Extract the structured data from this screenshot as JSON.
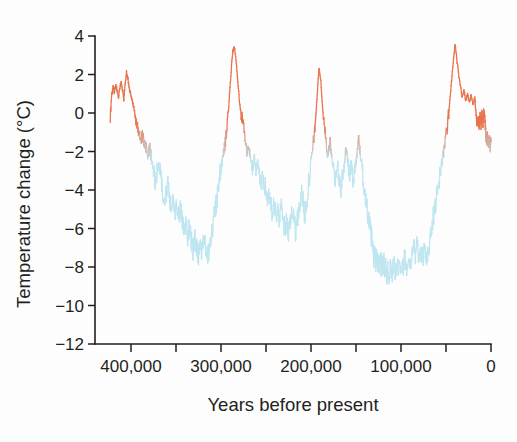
{
  "figure": {
    "background_color": "#fdfdfd",
    "text_color": "#231f20"
  },
  "chart_data": {
    "type": "line",
    "title": "",
    "subtitle": "",
    "xlabel": "Years before present",
    "ylabel": "Temperature change (°C)",
    "xlim": [
      440000,
      0
    ],
    "ylim": [
      -12,
      4
    ],
    "x_inverted": true,
    "grid": false,
    "legend": null,
    "legend_position": "none",
    "x_tick_labels": [
      "400,000",
      "300,000",
      "200,000",
      "100,000",
      "0"
    ],
    "x_tick_values": [
      400000,
      300000,
      200000,
      100000,
      0
    ],
    "x_minor_tick_values": [
      400000,
      350000,
      300000,
      250000,
      200000,
      150000,
      100000,
      50000,
      0
    ],
    "y_tick_labels": [
      "4",
      "2",
      "0",
      "−2",
      "−4",
      "−6",
      "−8",
      "−10",
      "−12"
    ],
    "y_tick_values": [
      4,
      2,
      0,
      -2,
      -4,
      -6,
      -8,
      -10,
      -12
    ],
    "colors": {
      "warm": "#e8734c",
      "cold": "#bfe6f0",
      "axis": "#231f20"
    },
    "color_threshold_c": -1.5,
    "series": [
      {
        "name": "Antarctic ice-core temperature change",
        "units": "°C",
        "x": [
          423000,
          421500,
          420000,
          418500,
          417000,
          415500,
          414000,
          412500,
          411000,
          409500,
          408000,
          406500,
          405000,
          403500,
          402000,
          400500,
          399000,
          397500,
          396000,
          394500,
          393000,
          391000,
          389000,
          387000,
          385000,
          383000,
          381000,
          379000,
          377000,
          375000,
          373000,
          371000,
          369000,
          367000,
          365000,
          363000,
          361000,
          359000,
          357000,
          355000,
          353000,
          351000,
          349000,
          347000,
          345000,
          343000,
          341000,
          339000,
          337000,
          335000,
          333000,
          331000,
          329000,
          327000,
          325000,
          323000,
          321000,
          319000,
          317000,
          315000,
          313000,
          311000,
          309000,
          307000,
          305000,
          303000,
          301000,
          299000,
          297000,
          295000,
          293000,
          291000,
          289000,
          287000,
          285000,
          283000,
          281000,
          279000,
          277000,
          275000,
          273000,
          271000,
          269000,
          267000,
          265000,
          263000,
          261000,
          259000,
          257000,
          255000,
          253000,
          251000,
          249000,
          247000,
          245000,
          243000,
          241000,
          239000,
          237000,
          235000,
          233000,
          231000,
          229000,
          227000,
          225000,
          223000,
          221000,
          219000,
          217000,
          215000,
          213000,
          211000,
          209000,
          207000,
          205000,
          203000,
          201000,
          199000,
          197000,
          195000,
          193000,
          191000,
          189000,
          187000,
          185000,
          183000,
          181000,
          179000,
          177000,
          175000,
          173000,
          171000,
          169000,
          167000,
          165000,
          163000,
          161000,
          159000,
          157000,
          155000,
          153000,
          151000,
          149000,
          147000,
          145000,
          143000,
          141000,
          139000,
          137000,
          135000,
          133000,
          131000,
          130000,
          129000,
          128000,
          127000,
          126000,
          125000,
          124000,
          123000,
          122000,
          121000,
          120000,
          119000,
          118000,
          117000,
          116000,
          115000,
          114000,
          112000,
          110000,
          108000,
          106000,
          104000,
          102000,
          100000,
          98000,
          96000,
          94000,
          92000,
          90000,
          88000,
          86000,
          84000,
          82000,
          80000,
          78000,
          76000,
          74000,
          72000,
          70000,
          68000,
          66000,
          64000,
          62000,
          60000,
          58000,
          56000,
          54000,
          52000,
          50000,
          48000,
          46000,
          44000,
          42000,
          40000,
          38000,
          36000,
          34000,
          32000,
          30000,
          28000,
          26000,
          24000,
          22000,
          20000,
          18000,
          17000,
          16000,
          15000,
          14000,
          13000,
          12000,
          11000,
          10000,
          9000,
          8000,
          7000,
          6000,
          5000,
          4000,
          3000,
          2000,
          1000,
          0
        ],
        "y": [
          -0.2,
          0.9,
          1.4,
          1.1,
          1.5,
          1.2,
          0.8,
          1.3,
          1.6,
          1.2,
          0.7,
          1.5,
          2.1,
          1.8,
          1.3,
          1.0,
          0.7,
          0.4,
          0.1,
          -0.3,
          -0.6,
          -1.0,
          -1.3,
          -1.2,
          -1.5,
          -1.8,
          -2.1,
          -1.9,
          -2.4,
          -3.0,
          -3.6,
          -3.1,
          -2.6,
          -3.3,
          -4.0,
          -4.6,
          -4.2,
          -3.8,
          -4.4,
          -5.0,
          -4.5,
          -5.2,
          -4.8,
          -5.5,
          -5.0,
          -5.6,
          -6.2,
          -5.7,
          -6.4,
          -6.0,
          -6.6,
          -7.1,
          -6.5,
          -7.0,
          -7.4,
          -6.9,
          -7.2,
          -6.6,
          -7.1,
          -7.5,
          -7.0,
          -6.4,
          -5.8,
          -5.2,
          -4.6,
          -3.9,
          -3.2,
          -2.6,
          -2.0,
          -1.4,
          -0.6,
          0.6,
          2.0,
          3.2,
          3.4,
          2.6,
          1.4,
          0.4,
          -0.2,
          -0.8,
          -1.4,
          -2.0,
          -1.6,
          -2.3,
          -2.9,
          -2.4,
          -3.1,
          -2.5,
          -3.2,
          -3.8,
          -3.2,
          -3.9,
          -4.5,
          -4.0,
          -4.7,
          -5.3,
          -4.8,
          -5.4,
          -4.9,
          -5.5,
          -5.0,
          -5.6,
          -6.1,
          -5.6,
          -6.2,
          -5.5,
          -4.9,
          -5.6,
          -6.2,
          -5.5,
          -4.8,
          -4.0,
          -4.6,
          -5.3,
          -4.6,
          -3.8,
          -3.0,
          -2.2,
          -1.4,
          -0.4,
          1.0,
          2.4,
          1.6,
          0.2,
          -0.8,
          -1.6,
          -2.2,
          -1.5,
          -2.2,
          -2.8,
          -3.4,
          -2.7,
          -3.4,
          -4.0,
          -3.3,
          -2.6,
          -1.9,
          -2.6,
          -3.3,
          -2.8,
          -3.5,
          -2.8,
          -2.1,
          -1.4,
          -2.2,
          -3.0,
          -3.8,
          -4.5,
          -5.2,
          -5.8,
          -6.4,
          -7.0,
          -7.6,
          -7.2,
          -7.8,
          -7.3,
          -7.9,
          -7.4,
          -8.0,
          -7.5,
          -8.1,
          -7.6,
          -8.2,
          -7.7,
          -8.3,
          -7.8,
          -8.4,
          -7.9,
          -8.5,
          -8.0,
          -8.4,
          -7.9,
          -8.3,
          -7.8,
          -8.2,
          -7.7,
          -8.1,
          -7.5,
          -8.0,
          -7.4,
          -7.9,
          -7.3,
          -6.8,
          -7.4,
          -6.9,
          -7.5,
          -7.0,
          -7.6,
          -7.1,
          -7.7,
          -7.2,
          -6.6,
          -6.0,
          -5.4,
          -4.8,
          -4.2,
          -3.6,
          -3.0,
          -2.4,
          -1.8,
          -1.2,
          -0.5,
          0.5,
          1.6,
          2.6,
          3.6,
          2.8,
          2.0,
          1.4,
          0.8,
          1.2,
          0.6,
          1.0,
          0.5,
          0.9,
          0.4,
          0.8,
          0.2,
          -0.2,
          -0.6,
          -0.3,
          -0.7,
          -0.2,
          -0.6,
          -0.1,
          -0.5,
          0.0,
          -0.4,
          -0.9,
          -1.4,
          -1.2,
          -1.7,
          -1.3,
          -1.8,
          -1.5
        ]
      }
    ]
  }
}
